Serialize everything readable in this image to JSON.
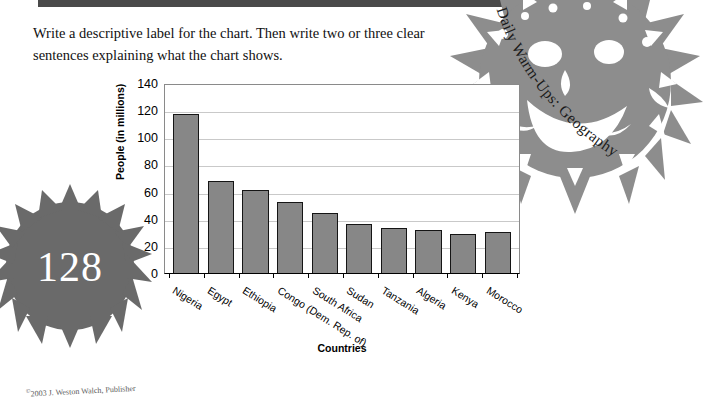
{
  "page": {
    "prompt_line_1": "Write a descriptive label for the chart. Then write two or three clear",
    "prompt_line_2": "sentences explaining what the chart shows.",
    "page_number": "128",
    "banner_title": "Daily Warm-Ups: Geography",
    "copyright_symbol": "©",
    "copyright_year": "2003",
    "copyright_publisher": "J. Weston Walch, Publisher"
  },
  "chart_data": {
    "type": "bar",
    "title": "",
    "xlabel": "Countries",
    "ylabel": "People (in millions)",
    "ylim": [
      0,
      140
    ],
    "yticks": [
      0,
      20,
      40,
      60,
      80,
      100,
      120,
      140
    ],
    "grid": true,
    "legend": "none",
    "bar_color": "#878787",
    "bar_outline_color": "#151515",
    "categories": [
      "Nigeria",
      "Egypt",
      "Ethiopia",
      "Congo (Dem. Rep. of)",
      "South Africa",
      "Sudan",
      "Tanzania",
      "Algeria",
      "Kenya",
      "Morocco"
    ],
    "values": [
      117,
      68,
      61,
      52,
      44,
      36,
      33,
      32,
      29,
      30
    ]
  }
}
